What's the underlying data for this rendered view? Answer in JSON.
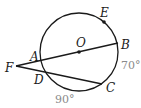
{
  "diagram": {
    "type": "circle-geometry",
    "circle": {
      "center_label": "O",
      "cx": 79,
      "cy": 52,
      "r": 39
    },
    "points": {
      "E": {
        "label": "E",
        "x": 104,
        "y": 22
      },
      "O": {
        "label": "O",
        "x": 79,
        "y": 52
      },
      "B": {
        "label": "B",
        "x": 118,
        "y": 43
      },
      "A": {
        "label": "A",
        "x": 40,
        "y": 61
      },
      "F": {
        "label": "F",
        "x": 16,
        "y": 66
      },
      "D": {
        "label": "D",
        "x": 43,
        "y": 73
      },
      "C": {
        "label": "C",
        "x": 102,
        "y": 84
      }
    },
    "segments": [
      {
        "from": "F",
        "to": "B",
        "name": "secant-through-diameter"
      },
      {
        "from": "F",
        "to": "C",
        "name": "secant-FC"
      }
    ],
    "arc_labels": {
      "BC": "70°",
      "DC": "90°"
    },
    "colors": {
      "stroke": "#1a1a1a",
      "arc_label": "#8a8a8a"
    }
  }
}
